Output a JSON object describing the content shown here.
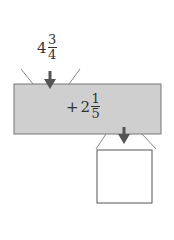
{
  "input": {
    "whole": "4",
    "numerator": "3",
    "denominator": "4"
  },
  "operation": {
    "operator": "+",
    "whole": "2",
    "numerator": "1",
    "denominator": "5"
  },
  "output": {
    "value": ""
  },
  "colors": {
    "machine_fill": "#cfcfcf",
    "stroke": "#666666",
    "arrow": "#555555"
  }
}
